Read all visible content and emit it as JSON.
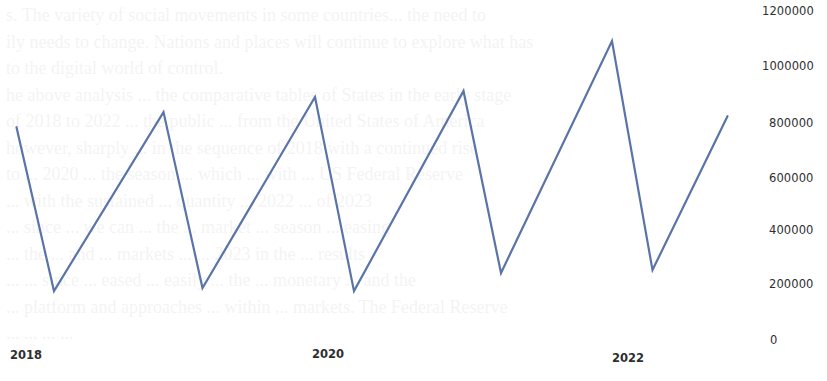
{
  "chart_data": {
    "type": "line",
    "title": "",
    "xlabel": "",
    "ylabel": "",
    "x_tick_labels": [
      "2018",
      "2020",
      "2022"
    ],
    "y_tick_labels": [
      "1200000",
      "1000000",
      "800000",
      "600000",
      "400000",
      "200000",
      "0"
    ],
    "ylim": [
      0,
      1200000
    ],
    "grid": false,
    "legend": null,
    "y_axis_position": "right",
    "series": [
      {
        "name": "series-1",
        "color": "#5a74a8",
        "x": [
          2017.95,
          2018.2,
          2018.93,
          2019.19,
          2019.94,
          2020.2,
          2020.93,
          2021.18,
          2021.92,
          2022.19,
          2022.69
        ],
        "values": [
          780000,
          182000,
          835000,
          193000,
          890000,
          182000,
          912000,
          248000,
          1094000,
          259000,
          820000
        ]
      }
    ]
  },
  "background": {
    "bleed_through_lines": [
      "s. The variety of social movements in some countries... the need to",
      "ily needs to change. Nations and places will continue to explore what has",
      "to the digital world of control.",
      "he above analysis ... the comparative tables of States in the early stage",
      "of 2018 to 2022 ... the public ... from the United States of America",
      "however, sharply ... in the sequence of 2018 with a continued rise",
      "to ... 2020 ... the season ... which ... with ... US Federal Reserve",
      "... with the sustained ... quantity ... 2022 ... of 2023",
      "... since ... we can ... the ... market ... season ... easing",
      "... the ... and ... markets ... ... 2023 in the ... results",
      "... ... since ... eased ... easily ... the ... monetary ... and the",
      "... platform and approaches ... within ... markets. The Federal Reserve",
      "... ... ... ..."
    ]
  }
}
